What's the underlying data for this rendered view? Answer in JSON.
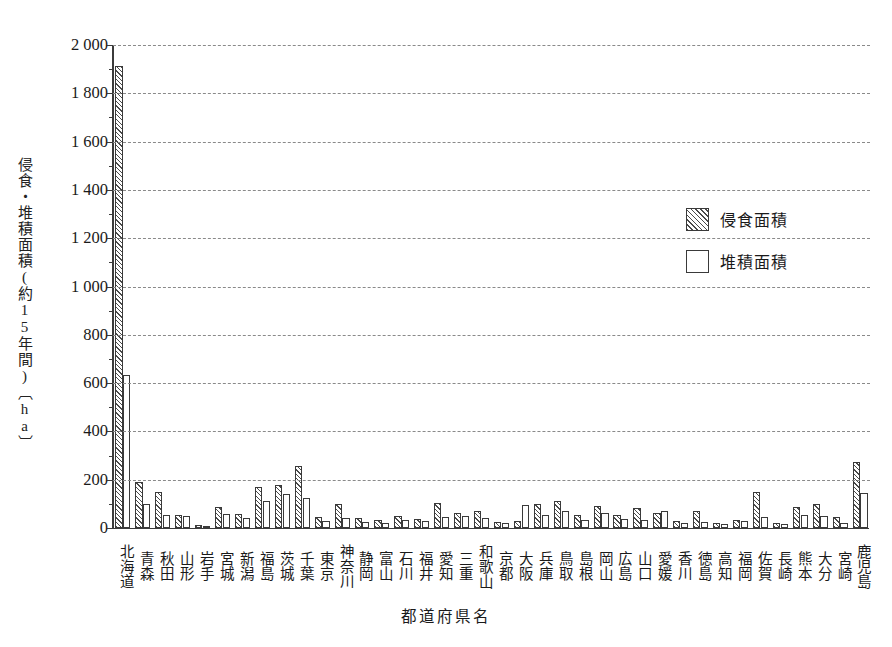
{
  "chart_data": {
    "type": "bar",
    "title": "",
    "xlabel": "都道府県名",
    "ylabel": "侵食・堆積面積(約15年間)〔ha〕",
    "ylim": [
      0,
      2000
    ],
    "ytick_values": [
      0,
      200,
      400,
      600,
      800,
      1000,
      1200,
      1400,
      1600,
      1800,
      2000
    ],
    "ytick_labels": [
      "0",
      "200",
      "400",
      "600",
      "800",
      "1 000",
      "1 200",
      "1 400",
      "1 600",
      "1 800",
      "2 000"
    ],
    "grid": true,
    "grid_style": "dashed-horizontal",
    "legend_position": "upper-right",
    "categories": [
      "北海道",
      "青森",
      "秋田",
      "山形",
      "岩手",
      "宮城",
      "新潟",
      "福島",
      "茨城",
      "千葉",
      "東京",
      "神奈川",
      "静岡",
      "富山",
      "石川",
      "福井",
      "愛知",
      "三重",
      "和歌山",
      "京都",
      "大阪",
      "兵庫",
      "鳥取",
      "島根",
      "岡山",
      "広島",
      "山口",
      "愛媛",
      "香川",
      "徳島",
      "高知",
      "福岡",
      "佐賀",
      "長崎",
      "熊本",
      "大分",
      "宮崎",
      "鹿児島"
    ],
    "series": [
      {
        "name": "侵食面積",
        "pattern": "hatched",
        "values": [
          1915,
          192,
          148,
          53,
          12,
          88,
          60,
          168,
          178,
          255,
          45,
          100,
          40,
          32,
          48,
          38,
          105,
          62,
          70,
          25,
          30,
          100,
          112,
          55,
          92,
          55,
          82,
          62,
          30,
          70,
          22,
          35,
          150,
          20,
          85,
          98,
          45,
          275
        ]
      },
      {
        "name": "堆積面積",
        "pattern": "open",
        "values": [
          635,
          98,
          52,
          48,
          10,
          58,
          42,
          110,
          140,
          125,
          28,
          42,
          25,
          22,
          32,
          28,
          46,
          48,
          42,
          22,
          95,
          52,
          72,
          35,
          62,
          38,
          32,
          72,
          22,
          25,
          18,
          28,
          45,
          15,
          52,
          48,
          22,
          145
        ]
      }
    ]
  },
  "legend": {
    "items": [
      {
        "label": "侵食面積",
        "pattern": "hatch"
      },
      {
        "label": "堆積面積",
        "pattern": "plain"
      }
    ]
  },
  "axes": {
    "y_title": "侵食・堆積面積(約15年間)〔ha〕",
    "x_title": "都道府県名"
  }
}
